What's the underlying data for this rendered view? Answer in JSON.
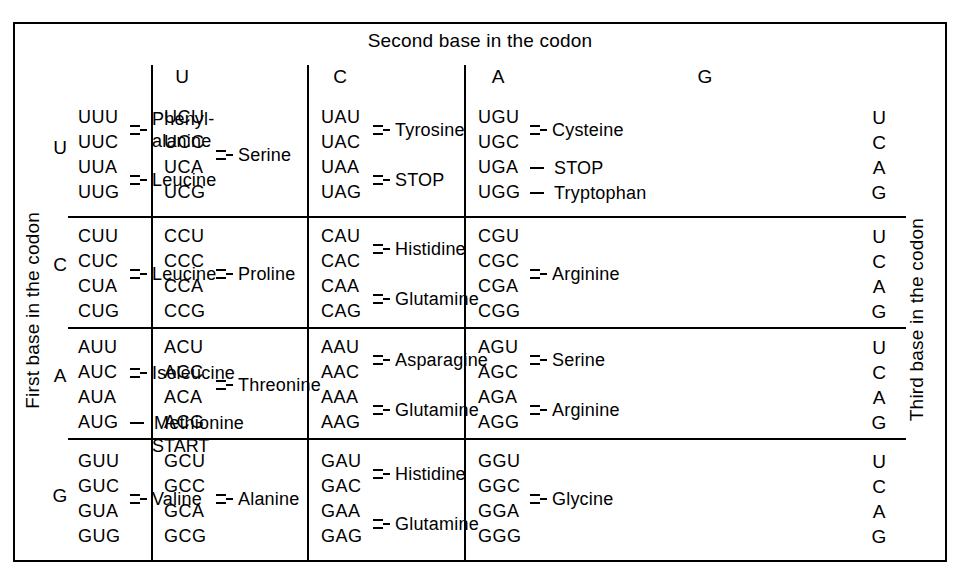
{
  "title_top": "Second base in the codon",
  "label_left": "First base in the codon",
  "label_right": "Third base in the codon",
  "second_base_headers": [
    "U",
    "C",
    "A",
    "G"
  ],
  "first_base_letters": [
    "U",
    "C",
    "A",
    "G"
  ],
  "third_base_letters": [
    "U",
    "C",
    "A",
    "G"
  ],
  "chart_data": {
    "type": "table",
    "row_axis": "First base in the codon",
    "col_axis": "Second base in the codon",
    "depth_axis": "Third base in the codon",
    "rows": [
      "U",
      "C",
      "A",
      "G"
    ],
    "cols": [
      "U",
      "C",
      "A",
      "G"
    ],
    "third": [
      "U",
      "C",
      "A",
      "G"
    ]
  },
  "cells": [
    [
      {
        "codons": [
          "UUU",
          "UUC",
          "UUA",
          "UUG"
        ],
        "groups": [
          {
            "size": 2,
            "marker": "brace",
            "name": "Phenyl-\nalanine"
          },
          {
            "size": 2,
            "marker": "brace",
            "name": "Leucine"
          }
        ]
      },
      {
        "codons": [
          "UCU",
          "UCC",
          "UCA",
          "UCG"
        ],
        "groups": [
          {
            "size": 4,
            "marker": "brace",
            "name": "Serine"
          }
        ]
      },
      {
        "codons": [
          "UAU",
          "UAC",
          "UAA",
          "UAG"
        ],
        "groups": [
          {
            "size": 2,
            "marker": "brace",
            "name": "Tyrosine"
          },
          {
            "size": 2,
            "marker": "brace",
            "name": "STOP"
          }
        ]
      },
      {
        "codons": [
          "UGU",
          "UGC",
          "UGA",
          "UGG"
        ],
        "groups": [
          {
            "size": 2,
            "marker": "brace",
            "name": "Cysteine"
          },
          {
            "size": 1,
            "marker": "dash",
            "name": "STOP"
          },
          {
            "size": 1,
            "marker": "dash",
            "name": "Tryptophan"
          }
        ]
      }
    ],
    [
      {
        "codons": [
          "CUU",
          "CUC",
          "CUA",
          "CUG"
        ],
        "groups": [
          {
            "size": 4,
            "marker": "brace",
            "name": "Leucine"
          }
        ]
      },
      {
        "codons": [
          "CCU",
          "CCC",
          "CCA",
          "CCG"
        ],
        "groups": [
          {
            "size": 4,
            "marker": "brace",
            "name": "Proline"
          }
        ]
      },
      {
        "codons": [
          "CAU",
          "CAC",
          "CAA",
          "CAG"
        ],
        "groups": [
          {
            "size": 2,
            "marker": "brace",
            "name": "Histidine"
          },
          {
            "size": 2,
            "marker": "brace",
            "name": "Glutamine"
          }
        ]
      },
      {
        "codons": [
          "CGU",
          "CGC",
          "CGA",
          "CGG"
        ],
        "groups": [
          {
            "size": 4,
            "marker": "brace",
            "name": "Arginine"
          }
        ]
      }
    ],
    [
      {
        "codons": [
          "AUU",
          "AUC",
          "AUA",
          "AUG"
        ],
        "groups": [
          {
            "size": 3,
            "marker": "brace",
            "name": "Isoleucine"
          },
          {
            "size": 1,
            "marker": "dash",
            "name": "Methionine"
          }
        ],
        "extra_note": "START"
      },
      {
        "codons": [
          "ACU",
          "ACC",
          "ACA",
          "ACG"
        ],
        "groups": [
          {
            "size": 4,
            "marker": "brace",
            "name": "Threonine"
          }
        ]
      },
      {
        "codons": [
          "AAU",
          "AAC",
          "AAA",
          "AAG"
        ],
        "groups": [
          {
            "size": 2,
            "marker": "brace",
            "name": "Asparagine"
          },
          {
            "size": 2,
            "marker": "brace",
            "name": "Glutamine"
          }
        ]
      },
      {
        "codons": [
          "AGU",
          "AGC",
          "AGA",
          "AGG"
        ],
        "groups": [
          {
            "size": 2,
            "marker": "brace",
            "name": "Serine"
          },
          {
            "size": 2,
            "marker": "brace",
            "name": "Arginine"
          }
        ]
      }
    ],
    [
      {
        "codons": [
          "GUU",
          "GUC",
          "GUA",
          "GUG"
        ],
        "groups": [
          {
            "size": 4,
            "marker": "brace",
            "name": "Valine"
          }
        ]
      },
      {
        "codons": [
          "GCU",
          "GCC",
          "GCA",
          "GCG"
        ],
        "groups": [
          {
            "size": 4,
            "marker": "brace",
            "name": "Alanine"
          }
        ]
      },
      {
        "codons": [
          "GAU",
          "GAC",
          "GAA",
          "GAG"
        ],
        "groups": [
          {
            "size": 2,
            "marker": "brace",
            "name": "Histidine"
          },
          {
            "size": 2,
            "marker": "brace",
            "name": "Glutamine"
          }
        ]
      },
      {
        "codons": [
          "GGU",
          "GGC",
          "GGA",
          "GGG"
        ],
        "groups": [
          {
            "size": 4,
            "marker": "brace",
            "name": "Glycine"
          }
        ]
      }
    ]
  ],
  "colors": {
    "ink": "#000000",
    "paper": "#ffffff"
  }
}
